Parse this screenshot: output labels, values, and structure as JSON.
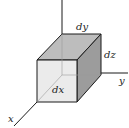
{
  "diagram": {
    "labels": {
      "dx": "dx",
      "dy": "dy",
      "dz": "dz",
      "x_axis": "x",
      "y_axis": "y"
    },
    "colors": {
      "front_face": "#e9e9e9",
      "top_face": "#bdbdbd",
      "right_face": "#9c9c9c",
      "edges": "#1a1a1a",
      "axes": "#1a1a1a"
    }
  }
}
